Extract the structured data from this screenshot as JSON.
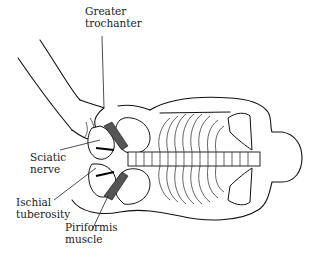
{
  "figure": {
    "colors": {
      "line": "#111111",
      "background": "#ffffff"
    }
  },
  "labels": {
    "greater_trochanter": "Greater\ntrochanter",
    "sciatic_nerve": "Sciatic\nnerve",
    "ischial_tuberosity": "Ischial\ntuberosity",
    "piriformis_muscle": "Piriformis\nmuscle"
  }
}
